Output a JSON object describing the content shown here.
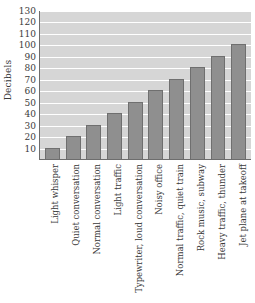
{
  "chart_data": {
    "type": "bar",
    "title": "",
    "xlabel": "",
    "ylabel": "Decibels",
    "ylim": [
      0,
      130
    ],
    "ytick_step": 10,
    "yticks": [
      130,
      120,
      110,
      100,
      90,
      80,
      70,
      60,
      50,
      40,
      30,
      20,
      10
    ],
    "grid": true,
    "legend": "none",
    "categories": [
      "Light whisper",
      "Quiet conversation",
      "Normal conversation",
      "Light traffic",
      "Typewriter, loud conversation",
      "Noisy office",
      "Normal traffic, quiet train",
      "Rock music, subway",
      "Heavy traffic, thunder",
      "Jet plane at takeoff"
    ],
    "values": [
      10,
      20,
      30,
      40,
      50,
      60,
      70,
      80,
      90,
      100
    ],
    "colors": {
      "bar_fill": "#8f8f8f",
      "bar_edge": "#6f6f6f",
      "plot_background": "#d6d6d6",
      "gridline": "#ffffff",
      "axis_line": "#6d6d6d",
      "text": "#3a3a3a",
      "page_background": "#ffffff"
    }
  }
}
